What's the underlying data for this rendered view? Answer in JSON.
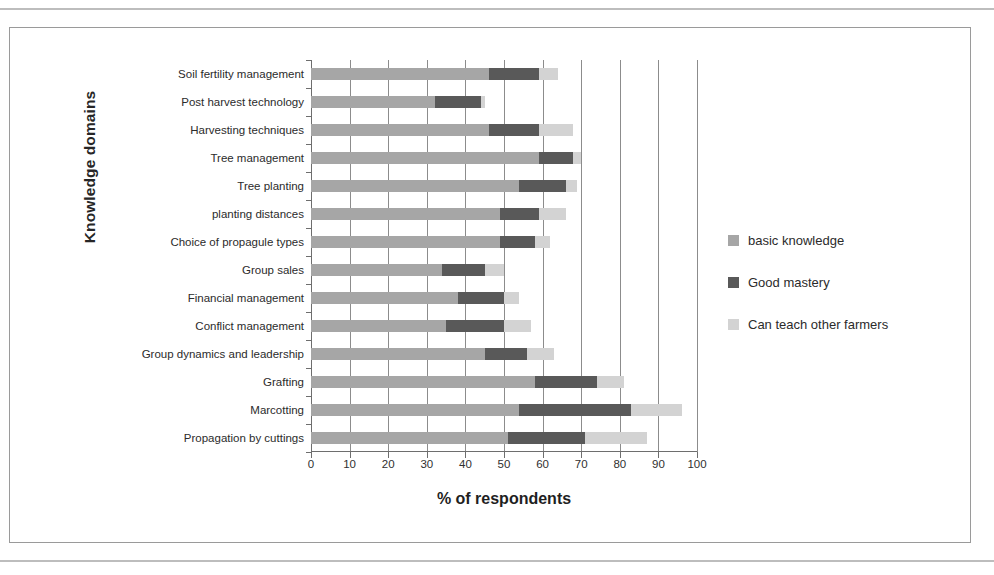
{
  "chart_data": {
    "type": "bar",
    "subtype": "stacked-horizontal",
    "title": "",
    "xlabel": "% of respondents",
    "ylabel": "Knowledge domains",
    "xlim": [
      0,
      100
    ],
    "xticks": [
      0,
      10,
      20,
      30,
      40,
      50,
      60,
      70,
      80,
      90,
      100
    ],
    "grid": true,
    "grid_axis": "x",
    "legend_position": "right",
    "categories": [
      "Soil fertility management",
      "Post harvest technology",
      "Harvesting techniques",
      "Tree management",
      "Tree planting",
      "planting distances",
      "Choice of propagule types",
      "Group sales",
      "Financial management",
      "Conflict management",
      "Group dynamics and leadership",
      "Grafting",
      "Marcotting",
      "Propagation by cuttings"
    ],
    "series": [
      {
        "name": "basic knowledge",
        "color": "#a6a6a6",
        "values": [
          46,
          32,
          46,
          59,
          54,
          49,
          49,
          34,
          38,
          35,
          45,
          58,
          54,
          51
        ]
      },
      {
        "name": "Good mastery",
        "color": "#595959",
        "values": [
          13,
          12,
          13,
          9,
          12,
          10,
          9,
          11,
          12,
          15,
          11,
          16,
          29,
          20
        ]
      },
      {
        "name": "Can  teach other farmers",
        "color": "#d3d3d3",
        "values": [
          5,
          1,
          9,
          2,
          3,
          7,
          4,
          5,
          4,
          7,
          7,
          7,
          13,
          16
        ]
      }
    ],
    "totals": [
      64,
      45,
      68,
      70,
      69,
      66,
      62,
      50,
      54,
      57,
      63,
      81,
      96,
      87
    ]
  },
  "legend": {
    "items": [
      {
        "label": "basic knowledge",
        "swatch": "basic"
      },
      {
        "label": "Good mastery",
        "swatch": "good"
      },
      {
        "label": "Can  teach other farmers",
        "swatch": "teach"
      }
    ]
  }
}
